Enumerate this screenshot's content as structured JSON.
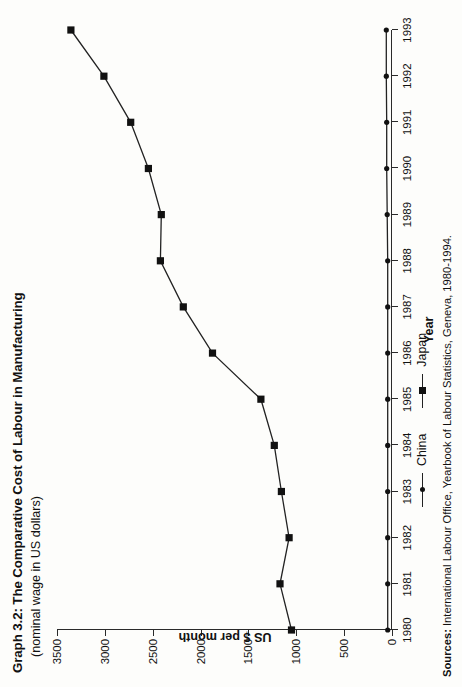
{
  "title": "Graph 3.2: The Comparative Cost of Labour in Manufacturing",
  "subtitle": "(nominal wage in US dollars)",
  "sources_label": "Sources:",
  "sources_text": " International Labour Office, Yearbook of Labour Statistics, Geneva, 1980-1994.",
  "legend": {
    "china": "China",
    "japan": "Japan"
  },
  "colors": {
    "line": "#222222",
    "marker": "#111111",
    "grid": "#9a9a9a",
    "axis": "#2a2a2a",
    "background": "#fdfdfb"
  },
  "chart_data": {
    "type": "line",
    "title": "Graph 3.2: The Comparative Cost of Labour in Manufacturing",
    "subtitle": "(nominal wage in US dollars)",
    "xlabel": "Year",
    "ylabel": "US $ per month",
    "x": [
      1980,
      1981,
      1982,
      1983,
      1984,
      1985,
      1986,
      1987,
      1988,
      1989,
      1990,
      1991,
      1992,
      1993
    ],
    "xticklabels": [
      "1980",
      "1981",
      "1982",
      "1983",
      "1984",
      "1985",
      "1986",
      "1987",
      "1988",
      "1989",
      "1990",
      "1991",
      "1992",
      "1993"
    ],
    "yticks": [
      0,
      500,
      1000,
      1500,
      2000,
      2500,
      3000,
      3500
    ],
    "yticklabels": [
      "0",
      "500",
      "1000",
      "1500",
      "2000",
      "2500",
      "3000",
      "3500"
    ],
    "ylim": [
      0,
      3500
    ],
    "xlim": [
      1980,
      1993
    ],
    "grid": "vertical-dashed-at-y-ticks",
    "legend_position": "below-axes",
    "series": [
      {
        "name": "Japan",
        "marker": "square",
        "values": [
          1050,
          1170,
          1075,
          1155,
          1230,
          1370,
          1875,
          2180,
          2420,
          2410,
          2545,
          2730,
          3010,
          3355
        ]
      },
      {
        "name": "China",
        "marker": "circle",
        "values": [
          45,
          45,
          45,
          45,
          45,
          45,
          45,
          45,
          45,
          50,
          55,
          55,
          60,
          60
        ]
      }
    ]
  }
}
